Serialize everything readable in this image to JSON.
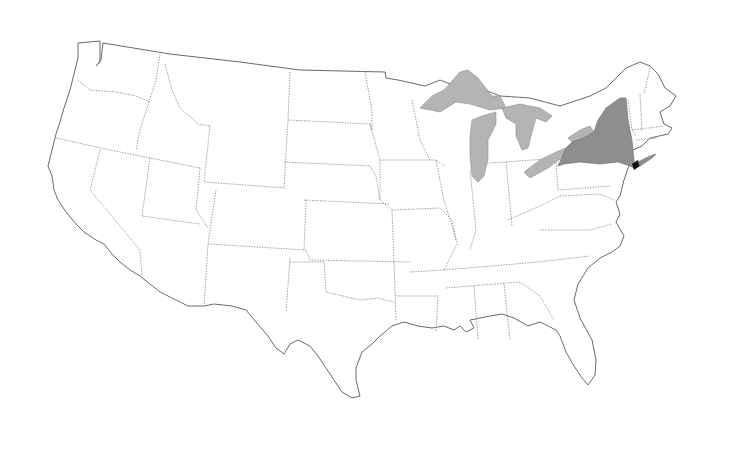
{
  "map": {
    "subject": "Contiguous United States",
    "highlighted_state": "New York",
    "highlighted_city": "New York City",
    "features": [
      {
        "name": "New York",
        "role": "highlighted-state",
        "color": "#8e8e8e"
      },
      {
        "name": "Great Lakes",
        "role": "water",
        "color": "#b4b4b4"
      },
      {
        "name": "New York City",
        "role": "city-marker",
        "color": "#111111"
      }
    ],
    "colors": {
      "background": "#ffffff",
      "land": "#ffffff",
      "outline": "#6a6a6a",
      "state_border": "#8a8a8a"
    }
  }
}
